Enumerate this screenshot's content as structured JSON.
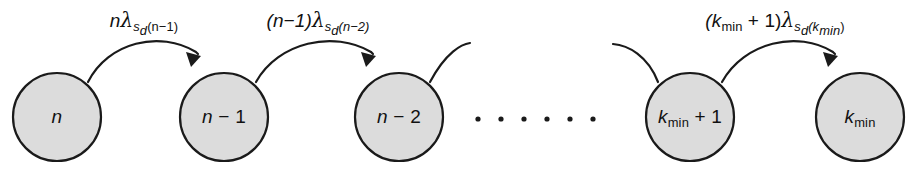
{
  "figure": {
    "type": "state-transition-diagram",
    "background_color": "#ffffff",
    "node_fill_color": "#dcdcdc",
    "stroke_color": "#1a1a1a"
  },
  "nodes": [
    {
      "id": "n",
      "cx": 57,
      "cy": 117,
      "r": 44,
      "label_main": "n",
      "label_sub": "",
      "label_tail": ""
    },
    {
      "id": "n-1",
      "cx": 224,
      "cy": 117,
      "r": 44,
      "label_main": "n",
      "label_sub": "",
      "label_tail": " − 1"
    },
    {
      "id": "n-2",
      "cx": 399,
      "cy": 117,
      "r": 44,
      "label_main": "n",
      "label_sub": "",
      "label_tail": " − 2"
    },
    {
      "id": "kmin+1",
      "cx": 690,
      "cy": 117,
      "r": 44,
      "label_main": "k",
      "label_sub": "min",
      "label_tail": " + 1"
    },
    {
      "id": "kmin",
      "cx": 860,
      "cy": 117,
      "r": 44,
      "label_main": "k",
      "label_sub": "min",
      "label_tail": ""
    }
  ],
  "edges": [
    {
      "id": "edge-n-to-n-1",
      "from": "n",
      "to": "n-1",
      "label": {
        "coef": "n",
        "lambda": "λ",
        "sub_s": "s",
        "sub_d": "d",
        "sub_arg": "(n−1)"
      },
      "label_x": 144,
      "label_y": 8
    },
    {
      "id": "edge-n-1-to-n-2",
      "from": "n-1",
      "to": "n-2",
      "label": {
        "coef": "(n−1)",
        "lambda": "λ",
        "sub_s": "s",
        "sub_d": "d",
        "sub_arg": "(n−2)"
      },
      "label_x": 318,
      "label_y": 8
    },
    {
      "id": "edge-kmin+1-to-kmin",
      "from": "kmin+1",
      "to": "kmin",
      "label": {
        "coef": "(k",
        "coef_sub": "min",
        "coef_tail": " + 1)",
        "lambda": "λ",
        "sub_s": "s",
        "sub_d": "d",
        "sub_arg_open": "(k",
        "sub_arg_sub": "min",
        "sub_arg_close": ")"
      },
      "label_x": 775,
      "label_y": 8
    }
  ],
  "partial_edges": [
    {
      "id": "stub-out-n-2",
      "direction": "outgoing",
      "from": "n-2"
    },
    {
      "id": "stub-in-kmin+1",
      "direction": "incoming",
      "to": "kmin+1"
    }
  ],
  "ellipsis": {
    "dot_count": 6,
    "y": 119,
    "start_x": 478,
    "spacing": 23,
    "radius": 2.6
  }
}
